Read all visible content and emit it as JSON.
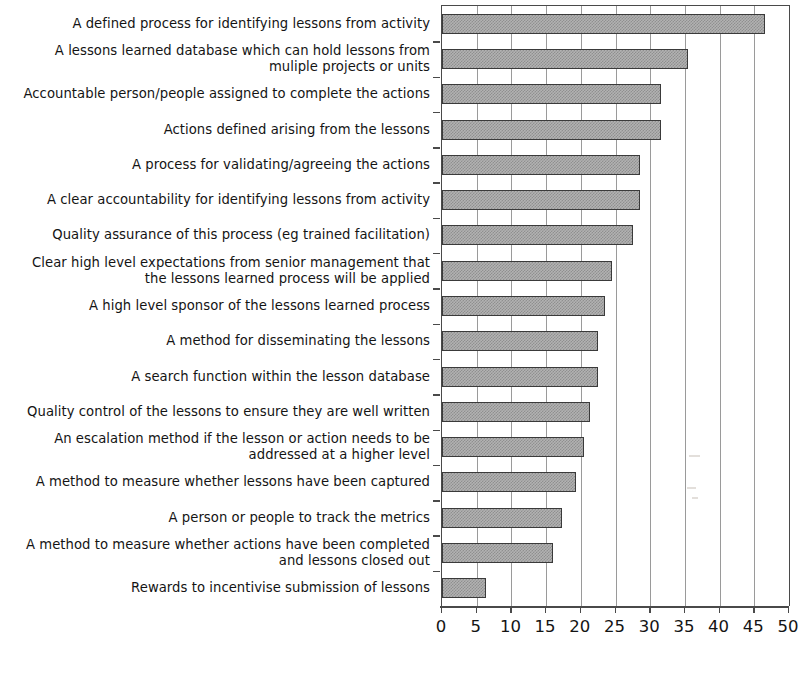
{
  "chart_data": {
    "type": "bar",
    "orientation": "horizontal",
    "title": "",
    "subtitle": "",
    "xlabel": "",
    "ylabel": "",
    "xlim": [
      0,
      50
    ],
    "ylim": null,
    "grid": true,
    "legend": null,
    "xticks": [
      "0",
      "5",
      "10",
      "15",
      "20",
      "25",
      "30",
      "35",
      "40",
      "45",
      "50"
    ],
    "xtick_values": [
      0,
      5,
      10,
      15,
      20,
      25,
      30,
      35,
      40,
      45,
      50
    ],
    "bar_fill_color": "#b2b2b2",
    "bar_edge_color": "#3a3a3a",
    "gridline_color": "#9a9a9a",
    "axis_color": "#4a4a4a",
    "categories": [
      "A defined process for identifying lessons from activity",
      "A lessons learned database which can hold lessons from\nmuliple projects or units",
      "Accountable person/people assigned to complete the actions",
      "Actions defined arising from the lessons",
      "A process for validating/agreeing the actions",
      "A clear accountability for identifying lessons from activity",
      "Quality assurance of this process (eg trained facilitation)",
      "Clear high level expectations from senior management that\nthe lessons learned process will be applied",
      "A high level sponsor of the lessons learned process",
      "A method for disseminating the lessons",
      "A search function within the lesson database",
      "Quality control of the lessons to ensure they are well written",
      "An escalation method if the lesson or action needs to be\naddressed at a higher level",
      "A method to measure whether lessons have been captured",
      "A person or people to track the metrics",
      "A method to measure whether actions have been completed\nand lessons closed out",
      "Rewards to incentivise submission of lessons"
    ],
    "values": [
      46.5,
      35.5,
      31.5,
      31.5,
      28.5,
      28.5,
      27.5,
      24.5,
      23.5,
      22.5,
      22.5,
      21.3,
      20.5,
      19.3,
      17.3,
      16.0,
      6.4
    ]
  }
}
